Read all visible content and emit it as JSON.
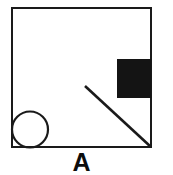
{
  "figure": {
    "label": "A",
    "label_color": "#0d0d0d",
    "background_color": "#ffffff",
    "stroke_color": "#1a1a1a",
    "fill_color": "#141414",
    "canvas": {
      "width": 173,
      "height": 175
    },
    "shapes": {
      "outer_square": {
        "name": "outer-square",
        "x": 12,
        "y": 8,
        "width": 139,
        "height": 139,
        "stroke_width": 2.4,
        "fill": "none",
        "stroke": "#1a1a1a"
      },
      "black_rectangle": {
        "name": "black-filled-rectangle",
        "x": 117,
        "y": 59,
        "width": 34,
        "height": 39,
        "fill": "#141414",
        "position_note": "upper-right, flush with right edge of square"
      },
      "circle": {
        "name": "circle",
        "cx": 30,
        "cy": 129.5,
        "r": 18,
        "stroke_width": 2.2,
        "fill": "none",
        "stroke": "#1a1a1a",
        "position_note": "lower-left, tangent to left and bottom edges"
      },
      "diagonal_line": {
        "name": "diagonal-line",
        "x1": 85,
        "y1": 86,
        "x2": 151,
        "y2": 147,
        "stroke_width": 2.6,
        "stroke": "#1a1a1a",
        "position_note": "runs to bottom-right corner of square"
      }
    }
  }
}
